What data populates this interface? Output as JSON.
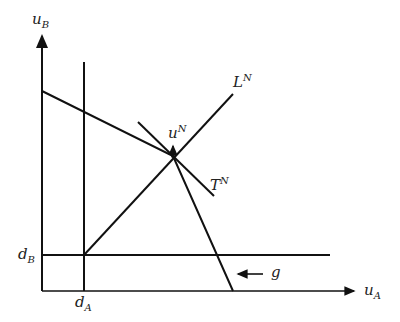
{
  "diagram": {
    "axes": {
      "y_label": {
        "base": "u",
        "sub": "B"
      },
      "x_label": {
        "base": "u",
        "sub": "A"
      }
    },
    "points": {
      "disagreement_x": {
        "base": "d",
        "sub": "A"
      },
      "disagreement_y": {
        "base": "d",
        "sub": "B"
      },
      "nash_point": {
        "base": "u",
        "sup": "N"
      }
    },
    "lines": {
      "L": {
        "base": "L",
        "sup": "N"
      },
      "T": {
        "base": "T",
        "sup": "N"
      }
    },
    "annotation": {
      "label": "g"
    },
    "colors": {
      "line": "#111111",
      "background": "#ffffff"
    }
  }
}
